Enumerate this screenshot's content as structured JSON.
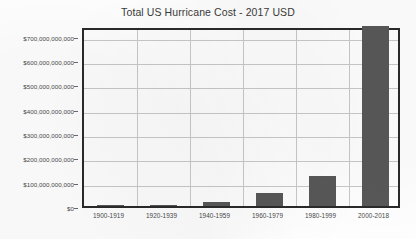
{
  "chart_data": {
    "type": "bar",
    "title": "Total US Hurricane Cost - 2017 USD",
    "xlabel": "",
    "ylabel": "",
    "categories": [
      "1900-1919",
      "1920-1939",
      "1940-1959",
      "1960-1979",
      "1980-1999",
      "2000-2018"
    ],
    "values": [
      1000000000,
      5000000000,
      17000000000,
      52000000000,
      125000000000,
      740000000000
    ],
    "ylim": [
      0,
      740000000000
    ],
    "ytick_values": [
      0,
      100000000000,
      200000000000,
      300000000000,
      400000000000,
      500000000000,
      600000000000,
      700000000000
    ],
    "ytick_labels": [
      "$0",
      "$100,000,000,000",
      "$200,000,000,000",
      "$300,000,000,000",
      "$400,000,000,000",
      "$500,000,000,000",
      "$600,000,000,000",
      "$700,000,000,000"
    ],
    "grid": true,
    "grid_axis": "both",
    "legend": false,
    "legend_position": "none",
    "bar_color": "#585858",
    "plot_border_color": "#2a2a2a",
    "gridline_color": "#c9c9c9",
    "background_color": "#ffffff",
    "series": [
      {
        "name": "Total US Hurricane Cost",
        "values": [
          1000000000,
          5000000000,
          17000000000,
          52000000000,
          125000000000,
          740000000000
        ]
      }
    ]
  }
}
